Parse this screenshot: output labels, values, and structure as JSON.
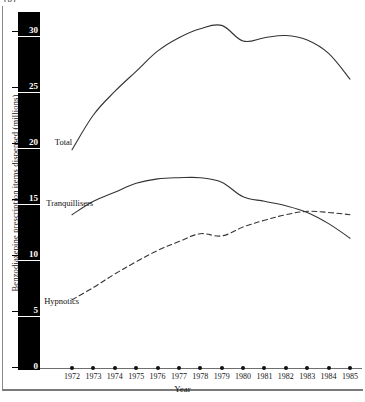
{
  "figure": {
    "top_cropped_text": "(b)",
    "background": "#ffffff"
  },
  "chart_data": {
    "type": "line",
    "title": "",
    "xlabel": "Year",
    "ylabel": "Benzodiazepine prescription items dispensed (millions)",
    "x": [
      1972,
      1973,
      1974,
      1975,
      1976,
      1977,
      1978,
      1979,
      1980,
      1981,
      1982,
      1983,
      1984,
      1985
    ],
    "categories": [
      "1972",
      "1973",
      "1974",
      "1975",
      "1976",
      "1977",
      "1978",
      "1979",
      "1980",
      "1981",
      "1982",
      "1983",
      "1984",
      "1985"
    ],
    "xlim": [
      1972,
      1985
    ],
    "ylim": [
      0,
      31.5
    ],
    "yticks": [
      0,
      5,
      10,
      15,
      20,
      25,
      30
    ],
    "ytick_labels": [
      "0",
      "5",
      "10",
      "15",
      "20",
      "25",
      "30"
    ],
    "grid": false,
    "legend": "inline-labels",
    "series": [
      {
        "name": "Total",
        "style": "solid",
        "color": "#333333",
        "label_x": 1972.6,
        "label_y": 20.1,
        "values": [
          19.4,
          22.5,
          24.6,
          26.4,
          28.2,
          29.4,
          30.2,
          30.5,
          29.1,
          29.4,
          29.6,
          29.2,
          28.0,
          25.7
        ]
      },
      {
        "name": "Tranquillisers",
        "style": "solid",
        "color": "#333333",
        "label_x": 1972.2,
        "label_y": 14.6,
        "values": [
          13.6,
          14.8,
          15.6,
          16.4,
          16.8,
          16.9,
          16.9,
          16.5,
          15.2,
          14.8,
          14.4,
          13.8,
          12.8,
          11.5
        ]
      },
      {
        "name": "Hypnotics",
        "style": "dashed",
        "color": "#333333",
        "label_x": 1972.1,
        "label_y": 5.9,
        "values": [
          6.0,
          7.1,
          8.3,
          9.4,
          10.4,
          11.2,
          11.9,
          11.7,
          12.5,
          13.1,
          13.6,
          13.9,
          13.8,
          13.6
        ]
      }
    ]
  }
}
